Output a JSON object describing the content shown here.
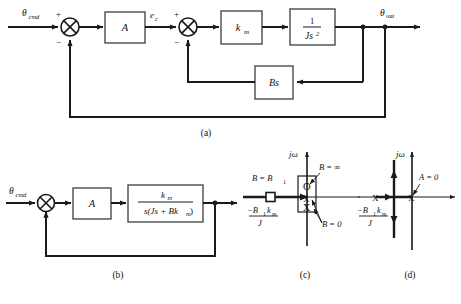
{
  "figure": {
    "panels": [
      {
        "id": "a",
        "label": "(a)",
        "caption": "(a)"
      },
      {
        "id": "b",
        "label": "(b)",
        "caption": "(b)"
      },
      {
        "id": "c",
        "label": "(c)",
        "caption": "(c)"
      },
      {
        "id": "d",
        "label": "(d)",
        "caption": "(d)"
      }
    ]
  },
  "panel_a": {
    "input_label": "θ",
    "input_sub": "cmd",
    "sum1_plus": "+",
    "sum1_minus": "−",
    "block_A": "A",
    "error_label": "e",
    "error_sub": "c",
    "sum2_plus": "+",
    "sum2_minus": "−",
    "block_km_num": "k",
    "block_km_sub": "m",
    "block_plant_num": "1",
    "block_plant_den": "Js",
    "block_plant_den_exp": "2",
    "block_Bs": "Bs",
    "output_label": "θ",
    "output_sub": "out"
  },
  "panel_b": {
    "input_label": "θ",
    "input_sub": "cmd",
    "block_A": "A",
    "tf_numerator": "k",
    "tf_numerator_sub": "m",
    "tf_denominator_pre": "s(Js + Bk",
    "tf_denominator_sub": "m",
    "tf_denominator_post": ")"
  },
  "panel_c": {
    "axis_imag": "jω",
    "label_B_eq_B1_pre": "B = B",
    "label_B_eq_B1_sub": "1",
    "label_B_infinity": "B = ∞",
    "label_B_zero": "B = 0",
    "pole_label_num_pre": "−B",
    "pole_label_num_sub": "1",
    "pole_label_num_k": "k",
    "pole_label_num_k_sub": "m",
    "pole_label_den": "J",
    "markers": {
      "zero_glyph": "O",
      "pole_glyph": "X",
      "square_glyph": "□"
    }
  },
  "panel_d": {
    "axis_imag": "jω",
    "label_A_zero": "A = 0",
    "pole_label_num_pre": "−B",
    "pole_label_num_sub": "1",
    "pole_label_num_k": "k",
    "pole_label_num_k_sub": "m",
    "pole_label_den": "J",
    "markers": {
      "pole_glyph": "X"
    }
  },
  "colors": {
    "line": "#1a1a1a",
    "text": "#111111",
    "background": "#ffffff"
  }
}
